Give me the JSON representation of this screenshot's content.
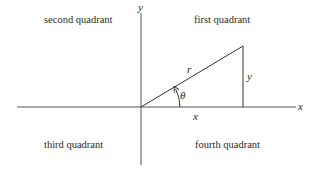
{
  "diagram": {
    "type": "cartesian-polar-coordinates",
    "quadrants": {
      "first": "first quadrant",
      "second": "second quadrant",
      "third": "third quadrant",
      "fourth": "fourth quadrant"
    },
    "axes": {
      "x_label": "x",
      "y_label": "y"
    },
    "triangle": {
      "hypotenuse_label": "r",
      "opposite_label": "y",
      "adjacent_label": "x",
      "angle_label": "θ"
    },
    "colors": {
      "line": "#333333",
      "text": "#2a2a2a"
    }
  }
}
